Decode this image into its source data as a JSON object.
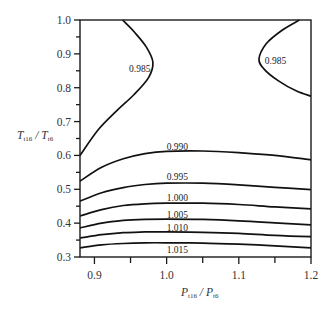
{
  "chart_data": {
    "type": "contour",
    "title": "",
    "xlabel": "P_t16 / P_t6",
    "ylabel": "T_t16 / T_t6",
    "xlabel_parts": {
      "main1": "P",
      "sub1": "t16",
      "sep": " / ",
      "main2": "P",
      "sub2": "t6"
    },
    "ylabel_parts": {
      "main1": "T",
      "sub1": "t16",
      "sep": " / ",
      "main2": "T",
      "sub2": "t6"
    },
    "xlim": [
      0.88,
      1.2
    ],
    "ylim": [
      0.3,
      1.0
    ],
    "grid": false,
    "legend": "none",
    "x_ticks": [
      {
        "value": 0.9,
        "label": "0.9"
      },
      {
        "value": 1.0,
        "label": "1.0"
      },
      {
        "value": 1.1,
        "label": "1.1"
      },
      {
        "value": 1.2,
        "label": "1.2"
      }
    ],
    "x_minor_ticks": [
      0.95,
      1.05,
      1.15
    ],
    "y_ticks": [
      {
        "value": 0.3,
        "label": "0.3"
      },
      {
        "value": 0.4,
        "label": "0.4"
      },
      {
        "value": 0.5,
        "label": "0.5"
      },
      {
        "value": 0.6,
        "label": "0.6"
      },
      {
        "value": 0.7,
        "label": "0.7"
      },
      {
        "value": 0.8,
        "label": "0.8"
      },
      {
        "value": 0.9,
        "label": "0.9"
      },
      {
        "value": 1.0,
        "label": "1.0"
      }
    ],
    "y_minor_ticks": [
      0.35,
      0.45,
      0.55,
      0.65,
      0.75,
      0.85,
      0.95
    ],
    "contours": [
      {
        "level": "0.985",
        "label_pos": [
          0.948,
          0.855
        ],
        "points": [
          [
            0.939,
            1.0
          ],
          [
            0.955,
            0.965
          ],
          [
            0.972,
            0.92
          ],
          [
            0.981,
            0.875
          ],
          [
            0.975,
            0.83
          ],
          [
            0.955,
            0.78
          ],
          [
            0.93,
            0.73
          ],
          [
            0.905,
            0.675
          ],
          [
            0.88,
            0.6
          ]
        ]
      },
      {
        "level": "0.985",
        "label_pos": [
          1.136,
          0.88
        ],
        "points": [
          [
            1.184,
            1.0
          ],
          [
            1.16,
            0.97
          ],
          [
            1.138,
            0.93
          ],
          [
            1.128,
            0.885
          ],
          [
            1.135,
            0.855
          ],
          [
            1.155,
            0.82
          ],
          [
            1.18,
            0.79
          ],
          [
            1.2,
            0.775
          ]
        ]
      },
      {
        "level": "0.990",
        "label_pos": [
          1.0,
          0.625
        ],
        "points": [
          [
            0.88,
            0.524
          ],
          [
            0.91,
            0.565
          ],
          [
            0.94,
            0.59
          ],
          [
            0.97,
            0.605
          ],
          [
            1.0,
            0.612
          ],
          [
            1.05,
            0.613
          ],
          [
            1.1,
            0.608
          ],
          [
            1.15,
            0.6
          ],
          [
            1.2,
            0.587
          ]
        ]
      },
      {
        "level": "0.995",
        "label_pos": [
          1.0,
          0.535
        ],
        "points": [
          [
            0.88,
            0.465
          ],
          [
            0.91,
            0.49
          ],
          [
            0.94,
            0.505
          ],
          [
            0.97,
            0.514
          ],
          [
            1.0,
            0.518
          ],
          [
            1.05,
            0.518
          ],
          [
            1.1,
            0.513
          ],
          [
            1.15,
            0.506
          ],
          [
            1.2,
            0.499
          ]
        ]
      },
      {
        "level": "1.000",
        "label_pos": [
          1.0,
          0.475
        ],
        "points": [
          [
            0.88,
            0.421
          ],
          [
            0.91,
            0.44
          ],
          [
            0.94,
            0.452
          ],
          [
            0.97,
            0.457
          ],
          [
            1.0,
            0.459
          ],
          [
            1.05,
            0.459
          ],
          [
            1.1,
            0.455
          ],
          [
            1.15,
            0.448
          ],
          [
            1.2,
            0.442
          ]
        ]
      },
      {
        "level": "1.005",
        "label_pos": [
          1.0,
          0.425
        ],
        "points": [
          [
            0.88,
            0.386
          ],
          [
            0.91,
            0.4
          ],
          [
            0.94,
            0.408
          ],
          [
            0.97,
            0.411
          ],
          [
            1.0,
            0.412
          ],
          [
            1.05,
            0.411
          ],
          [
            1.1,
            0.407
          ],
          [
            1.15,
            0.401
          ],
          [
            1.2,
            0.395
          ]
        ]
      },
      {
        "level": "1.010",
        "label_pos": [
          1.0,
          0.385
        ],
        "points": [
          [
            0.88,
            0.356
          ],
          [
            0.91,
            0.366
          ],
          [
            0.94,
            0.372
          ],
          [
            0.97,
            0.374
          ],
          [
            1.0,
            0.374
          ],
          [
            1.05,
            0.373
          ],
          [
            1.1,
            0.37
          ],
          [
            1.15,
            0.364
          ],
          [
            1.2,
            0.36
          ]
        ]
      },
      {
        "level": "1.015",
        "label_pos": [
          1.0,
          0.322
        ],
        "points": [
          [
            0.88,
            0.327
          ],
          [
            0.91,
            0.336
          ],
          [
            0.94,
            0.34
          ],
          [
            0.97,
            0.342
          ],
          [
            1.0,
            0.342
          ],
          [
            1.05,
            0.341
          ],
          [
            1.1,
            0.338
          ],
          [
            1.15,
            0.333
          ],
          [
            1.2,
            0.327
          ]
        ]
      }
    ]
  },
  "axes": {
    "x_title": {
      "main1": "P",
      "sub1": "t16",
      "sep": " / ",
      "main2": "P",
      "sub2": "t6"
    },
    "y_title": {
      "main1": "T",
      "sub1": "t16",
      "sep": " / ",
      "main2": "T",
      "sub2": "t6"
    }
  }
}
